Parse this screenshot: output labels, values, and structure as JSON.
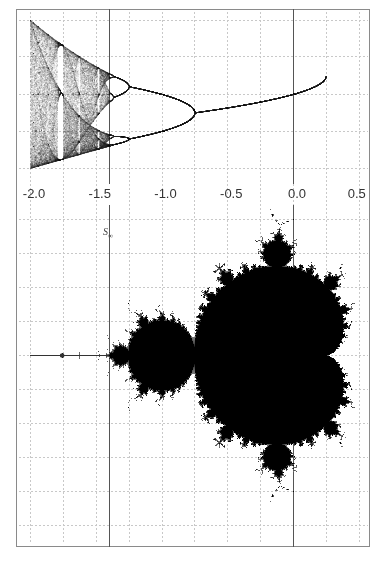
{
  "chart_data": [
    {
      "type": "scatter",
      "title": "",
      "description": "Bifurcation diagram of z -> z^2 + c (orbit of 0) for real c",
      "xlabel": "",
      "ylabel": "",
      "xlim": [
        -2.0,
        0.5
      ],
      "ylim": [
        -2.0,
        2.0
      ],
      "grid": true,
      "features": {
        "period_doubling_points": [
          -0.75,
          -1.25,
          -1.368
        ],
        "onset_of_chaos": -1.401,
        "period3_window": -1.75
      }
    },
    {
      "type": "heatmap",
      "title": "",
      "description": "Mandelbrot set in the complex c-plane (aligned real axis with bifurcation diagram)",
      "xlabel": "",
      "ylabel": "",
      "xlim": [
        -2.0,
        0.5
      ],
      "ylim": [
        -1.4,
        1.3
      ],
      "grid": true,
      "x_ticks": [
        "-2.0",
        "-1.5",
        "-1.0",
        "-0.5",
        "0.0",
        "0.5"
      ],
      "x_tick_values": [
        -2.0,
        -1.5,
        -1.0,
        -0.5,
        0.0,
        0.5
      ],
      "annotations": [
        {
          "text": "S∞",
          "x": -1.401
        }
      ],
      "reference_lines": [
        {
          "axis": "x",
          "value": -1.401
        },
        {
          "axis": "x",
          "value": 0.0
        }
      ]
    }
  ],
  "labels": {
    "annotation": "S∞"
  },
  "colors": {
    "set": "#000000",
    "grid": "#c8c8c8",
    "axis_line": "#555555",
    "frame": "#8a8a8a"
  }
}
